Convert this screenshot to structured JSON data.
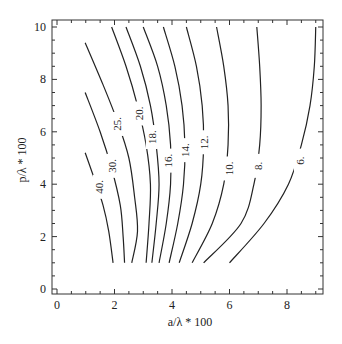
{
  "chart_data": {
    "type": "contour",
    "title": "",
    "xlabel": "a/λ * 100",
    "ylabel": "p/λ * 100",
    "xlim": [
      -0.15,
      9.2
    ],
    "ylim": [
      -0.1,
      10.3
    ],
    "xticks": [
      0,
      2,
      4,
      6,
      8
    ],
    "yticks": [
      0,
      2,
      4,
      6,
      8,
      10
    ],
    "grid": false,
    "legend": null,
    "contour_levels": [
      40,
      30,
      25,
      20,
      18,
      16,
      14,
      12,
      10,
      8,
      6
    ],
    "contours": [
      {
        "level": 40,
        "label": "40.",
        "points": [
          [
            0.98,
            5.2
          ],
          [
            1.3,
            4.2
          ],
          [
            1.6,
            3.2
          ],
          [
            1.8,
            2.2
          ],
          [
            1.95,
            1.0
          ]
        ],
        "label_at": [
          1.45,
          3.9
        ]
      },
      {
        "level": 30,
        "label": "30.",
        "points": [
          [
            0.98,
            7.5
          ],
          [
            1.5,
            6.0
          ],
          [
            1.9,
            4.6
          ],
          [
            2.2,
            3.2
          ],
          [
            2.3,
            2.0
          ],
          [
            2.35,
            1.0
          ]
        ],
        "label_at": [
          1.92,
          4.7
        ]
      },
      {
        "level": 25,
        "label": "25.",
        "points": [
          [
            0.98,
            9.4
          ],
          [
            1.6,
            7.8
          ],
          [
            2.1,
            6.4
          ],
          [
            2.5,
            5.0
          ],
          [
            2.7,
            3.5
          ],
          [
            2.8,
            2.2
          ],
          [
            2.6,
            1.0
          ]
        ],
        "label_at": [
          2.1,
          6.3
        ]
      },
      {
        "level": 20,
        "label": "20.",
        "points": [
          [
            1.9,
            10.0
          ],
          [
            2.4,
            8.5
          ],
          [
            2.8,
            7.0
          ],
          [
            3.1,
            5.5
          ],
          [
            3.25,
            4.0
          ],
          [
            3.2,
            2.5
          ],
          [
            3.1,
            1.0
          ]
        ],
        "label_at": [
          2.85,
          6.7
        ]
      },
      {
        "level": 18,
        "label": "18.",
        "points": [
          [
            2.4,
            10.0
          ],
          [
            2.9,
            8.5
          ],
          [
            3.25,
            7.0
          ],
          [
            3.45,
            5.5
          ],
          [
            3.55,
            4.0
          ],
          [
            3.45,
            2.5
          ],
          [
            3.3,
            1.0
          ]
        ],
        "label_at": [
          3.3,
          5.8
        ]
      },
      {
        "level": 16,
        "label": "16.",
        "points": [
          [
            3.0,
            10.0
          ],
          [
            3.5,
            8.5
          ],
          [
            3.8,
            7.0
          ],
          [
            3.95,
            5.5
          ],
          [
            3.95,
            4.0
          ],
          [
            3.8,
            2.5
          ],
          [
            3.55,
            1.0
          ]
        ],
        "label_at": [
          3.85,
          4.9
        ]
      },
      {
        "level": 14,
        "label": "14.",
        "points": [
          [
            3.7,
            10.0
          ],
          [
            4.1,
            8.5
          ],
          [
            4.35,
            7.0
          ],
          [
            4.45,
            5.5
          ],
          [
            4.4,
            4.0
          ],
          [
            4.2,
            2.5
          ],
          [
            3.9,
            1.0
          ]
        ],
        "label_at": [
          4.45,
          5.3
        ]
      },
      {
        "level": 12,
        "label": "12.",
        "points": [
          [
            4.5,
            10.0
          ],
          [
            4.85,
            8.5
          ],
          [
            5.05,
            7.0
          ],
          [
            5.1,
            5.5
          ],
          [
            5.0,
            4.0
          ],
          [
            4.7,
            2.5
          ],
          [
            4.25,
            1.0
          ]
        ],
        "label_at": [
          5.1,
          5.6
        ]
      },
      {
        "level": 10,
        "label": "10.",
        "points": [
          [
            5.55,
            10.0
          ],
          [
            5.8,
            8.5
          ],
          [
            5.95,
            7.0
          ],
          [
            5.95,
            5.5
          ],
          [
            5.8,
            4.0
          ],
          [
            5.4,
            2.5
          ],
          [
            4.7,
            1.0
          ]
        ],
        "label_at": [
          5.98,
          4.6
        ]
      },
      {
        "level": 8,
        "label": "8.",
        "points": [
          [
            6.95,
            10.0
          ],
          [
            7.05,
            8.5
          ],
          [
            7.1,
            7.0
          ],
          [
            7.05,
            5.5
          ],
          [
            6.85,
            4.0
          ],
          [
            6.4,
            2.5
          ],
          [
            5.1,
            1.0
          ]
        ],
        "label_at": [
          7.0,
          4.7
        ]
      },
      {
        "level": 6,
        "label": "6.",
        "points": [
          [
            9.0,
            10.0
          ],
          [
            8.95,
            8.5
          ],
          [
            8.8,
            7.0
          ],
          [
            8.5,
            5.5
          ],
          [
            8.05,
            4.0
          ],
          [
            7.2,
            2.5
          ],
          [
            6.0,
            1.0
          ]
        ],
        "label_at": [
          8.45,
          4.9
        ]
      }
    ]
  },
  "axes": {
    "x_title": "a/λ * 100",
    "y_title": "p/λ * 100",
    "x_tick_labels": [
      "0",
      "2",
      "4",
      "6",
      "8"
    ],
    "y_tick_labels": [
      "0",
      "2",
      "4",
      "6",
      "8",
      "10"
    ]
  }
}
